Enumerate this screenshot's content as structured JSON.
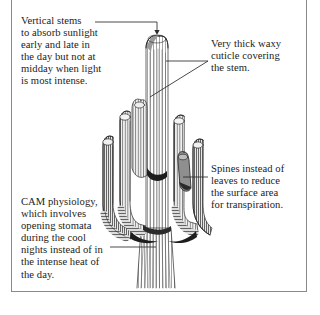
{
  "figure": {
    "frame": {
      "color": "#8a8a8a"
    },
    "background": "#ffffff",
    "ink": "#1b1b1b"
  },
  "annotations": [
    {
      "id": "vertical-stems",
      "text": "Vertical stems\nto absorb sunlight\nearly and late in\nthe day but not at\nmidday when light\nis most intense.",
      "position": "top-left",
      "leader": "horizontal-with-down-arrow"
    },
    {
      "id": "waxy-cuticle",
      "text": "Very thick waxy\ncuticle covering\nthe stem.",
      "position": "top-right",
      "leader": "two-branch-horizontal-and-diagonal"
    },
    {
      "id": "spines",
      "text": "Spines instead of\nleaves to reduce\nthe surface area\nfor transpiration.",
      "position": "middle-right",
      "leader": "horizontal"
    },
    {
      "id": "cam-physiology",
      "text": "CAM physiology,\nwhich involves\nopening stomata\nduring the cool\nnights instead of in\nthe intense heat of\nthe day.",
      "position": "bottom-left",
      "leader": "horizontal"
    }
  ],
  "illustration": {
    "name": "saguaro-cactus",
    "style": "pen-and-ink-hatching",
    "parts": [
      "central-vertical-stem",
      "left-outer-arm",
      "left-inner-arm",
      "right-inner-arm",
      "right-outer-arm",
      "short-front-arm",
      "ribbed-trunk-base"
    ]
  }
}
